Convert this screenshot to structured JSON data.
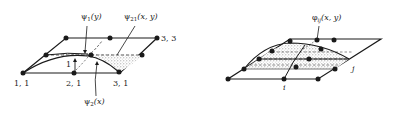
{
  "figure_left": {
    "title": "Bilinear shape function on 3x3 node grid",
    "node_labels": {
      "n11": "1, 1",
      "n21": "2, 1",
      "n31": "3, 1",
      "n33": "3, 3"
    },
    "height_label": "1",
    "function_labels": {
      "psi1": "ψ",
      "psi1_sub": "1",
      "psi1_arg": "(y)",
      "psi21": "ψ",
      "psi21_sub": "21",
      "psi21_arg": "(x, y)",
      "psi2": "ψ",
      "psi2_sub": "2",
      "psi2_arg": "(x)"
    }
  },
  "figure_right": {
    "title": "Global basis function phi_ij on node grid",
    "function_labels": {
      "phi": "φ",
      "phi_sub": "ij",
      "phi_arg": "(x, y)"
    },
    "index_labels": {
      "i": "i",
      "j": "j"
    }
  },
  "colors": {
    "line": "#1a1a1a",
    "stipple": "#9a9a9a",
    "background": "#ffffff"
  }
}
